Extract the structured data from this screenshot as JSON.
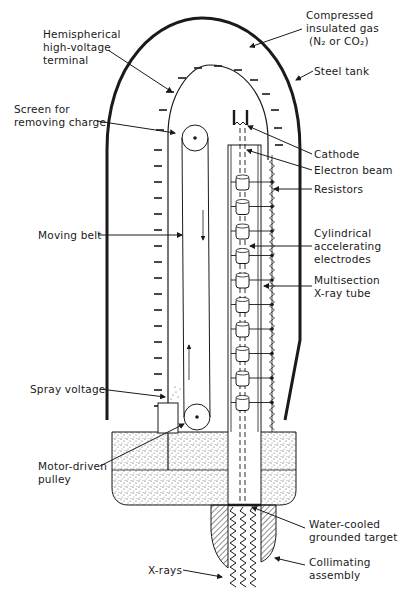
{
  "labels": {
    "terminal": [
      "Hemispherical",
      "high-voltage",
      "terminal"
    ],
    "gas": [
      "Compressed",
      "insulated gas",
      "(N₂ or CO₂)"
    ],
    "steel_tank": "Steel tank",
    "screen": [
      "Screen for",
      "removing charge"
    ],
    "cathode": "Cathode",
    "electron_beam": "Electron beam",
    "resistors": "Resistors",
    "electrodes": [
      "Cylindrical",
      "accelerating",
      "electrodes"
    ],
    "xray_tube": [
      "Multisection",
      "X-ray tube"
    ],
    "moving_belt": "Moving belt",
    "spray_voltage": "Spray voltage",
    "pulley": [
      "Motor-driven",
      "pulley"
    ],
    "target": [
      "Water-cooled",
      "grounded target"
    ],
    "collimator": [
      "Collimating",
      "assembly"
    ],
    "xrays": "X-rays"
  },
  "counts": {
    "accelerating_electrodes": 10
  },
  "colors": {
    "ink": "#1a1a1a",
    "background": "#ffffff"
  }
}
